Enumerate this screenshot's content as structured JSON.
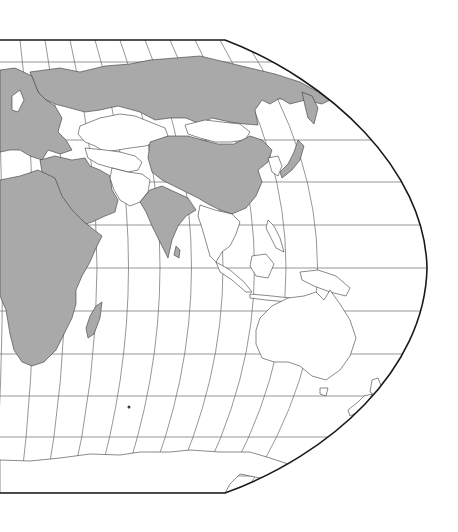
{
  "map": {
    "projection": "Robinson (eastern hemisphere crop)",
    "graticule": {
      "meridian_spacing_deg": 15,
      "parallel_spacing_deg": 10,
      "equator_y": 268,
      "right_edge_meridian": "180°E"
    },
    "colors": {
      "shaded_country": "#a9a9a9",
      "unshaded_country": "#ffffff",
      "ocean": "#ffffff",
      "border": "#3a3a3a",
      "frame": "#1a1a1a",
      "graticule": "#6a6a6a"
    },
    "legend": {
      "shaded_label": "",
      "unshaded_label": ""
    },
    "regions_shaded": [
      "Europe",
      "Russia",
      "Africa",
      "Middle East",
      "India",
      "China",
      "Japan",
      "Sri Lanka",
      "Madagascar"
    ],
    "regions_unshaded": [
      "Kazakhstan",
      "Central Asia",
      "Afghanistan",
      "Pakistan",
      "Mongolia",
      "Korea",
      "Southeast Asia",
      "Indonesia",
      "Philippines",
      "Papua New Guinea",
      "Australia",
      "New Zealand",
      "Antarctica"
    ]
  }
}
